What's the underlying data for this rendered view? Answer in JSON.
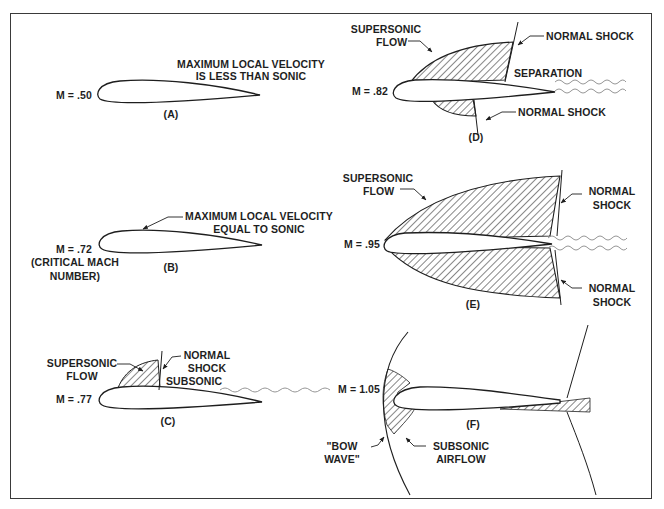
{
  "figure": {
    "panels": {
      "A": {
        "id": "(A)",
        "mach": "M = .50",
        "note_line1": "MAXIMUM LOCAL VELOCITY",
        "note_line2": "IS LESS THAN SONIC"
      },
      "B": {
        "id": "(B)",
        "mach": "M = .72",
        "mach_note_line1": "(CRITICAL MACH",
        "mach_note_line2": "NUMBER)",
        "note_line1": "MAXIMUM LOCAL VELOCITY",
        "note_line2": "EQUAL TO SONIC"
      },
      "C": {
        "id": "(C)",
        "mach": "M = .77",
        "supersonic_line1": "SUPERSONIC",
        "supersonic_line2": "FLOW",
        "shock_line1": "NORMAL",
        "shock_line2": "SHOCK",
        "subsonic": "SUBSONIC"
      },
      "D": {
        "id": "(D)",
        "mach": "M = .82",
        "supersonic_line1": "SUPERSONIC",
        "supersonic_line2": "FLOW",
        "upper_shock": "NORMAL SHOCK",
        "separation": "SEPARATION",
        "lower_shock": "NORMAL SHOCK"
      },
      "E": {
        "id": "(E)",
        "mach": "M = .95",
        "supersonic_line1": "SUPERSONIC",
        "supersonic_line2": "FLOW",
        "upper_shock_line1": "NORMAL",
        "upper_shock_line2": "SHOCK",
        "lower_shock_line1": "NORMAL",
        "lower_shock_line2": "SHOCK"
      },
      "F": {
        "id": "(F)",
        "mach": "M = 1.05",
        "bow_line1": "\"BOW",
        "bow_line2": "WAVE\"",
        "subsonic_line1": "SUBSONIC",
        "subsonic_line2": "AIRFLOW"
      }
    },
    "colors": {
      "ink": "#1e1e1e",
      "wake": "#8a8a8a",
      "background": "#ffffff"
    }
  }
}
